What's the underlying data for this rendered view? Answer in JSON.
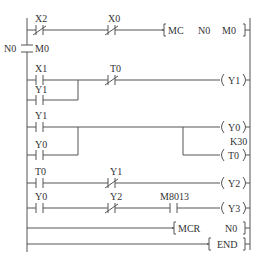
{
  "diagram": {
    "type": "ladder-logic",
    "colors": {
      "line": "#555555",
      "text": "#333333",
      "background": "#ffffff"
    },
    "master_control": {
      "nest": "N0",
      "relay": "M0"
    },
    "rungs": [
      {
        "id": 1,
        "contacts": [
          {
            "label": "X2",
            "type": "normally-closed"
          },
          {
            "label": "X0",
            "type": "normally-closed"
          }
        ],
        "output": {
          "kind": "instruction",
          "text": "MC",
          "args": [
            "N0",
            "M0"
          ]
        }
      },
      {
        "id": 2,
        "contacts": [
          {
            "label": "X1",
            "type": "normally-open"
          },
          {
            "label": "Y1",
            "type": "normally-open",
            "parallel_with": "X1"
          },
          {
            "label": "T0",
            "type": "normally-closed"
          }
        ],
        "output": {
          "kind": "coil",
          "text": "Y1"
        }
      },
      {
        "id": 3,
        "contacts": [
          {
            "label": "Y1",
            "type": "normally-open"
          },
          {
            "label": "Y0",
            "type": "normally-open",
            "parallel_with": "Y1"
          }
        ],
        "outputs": [
          {
            "kind": "coil",
            "text": "Y0"
          },
          {
            "kind": "timer",
            "text": "T0",
            "preset": "K30"
          }
        ]
      },
      {
        "id": 4,
        "contacts": [
          {
            "label": "T0",
            "type": "normally-open"
          },
          {
            "label": "Y1",
            "type": "normally-closed"
          }
        ],
        "output": {
          "kind": "coil",
          "text": "Y2"
        }
      },
      {
        "id": 5,
        "contacts": [
          {
            "label": "Y0",
            "type": "normally-open"
          },
          {
            "label": "Y2",
            "type": "normally-closed"
          },
          {
            "label": "M8013",
            "type": "normally-open"
          }
        ],
        "output": {
          "kind": "coil",
          "text": "Y3"
        }
      },
      {
        "id": 6,
        "contacts": [],
        "output": {
          "kind": "instruction",
          "text": "MCR",
          "args": [
            "N0"
          ]
        }
      },
      {
        "id": 7,
        "contacts": [],
        "output": {
          "kind": "instruction",
          "text": "END",
          "args": []
        }
      }
    ],
    "labels": {
      "r1_c1": "X2",
      "r1_c2": "X0",
      "r1_instr": "MC",
      "r1_arg1": "N0",
      "r1_arg2": "M0",
      "mc_nest": "N0",
      "mc_relay": "M0",
      "r2_c1": "X1",
      "r2_c1b": "Y1",
      "r2_c2": "T0",
      "r2_coil": "Y1",
      "r3_c1": "Y1",
      "r3_c1b": "Y0",
      "r3_coil1": "Y0",
      "r3_preset": "K30",
      "r3_coil2": "T0",
      "r4_c1": "T0",
      "r4_c2": "Y1",
      "r4_coil": "Y2",
      "r5_c1": "Y0",
      "r5_c2": "Y2",
      "r5_c3": "M8013",
      "r5_coil": "Y3",
      "r6_instr": "MCR",
      "r6_arg1": "N0",
      "r7_instr": "END"
    }
  }
}
